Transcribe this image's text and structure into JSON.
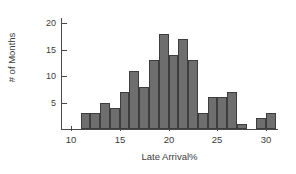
{
  "chart_data": {
    "type": "bar",
    "title": "",
    "xlabel": "Late Arrival%",
    "ylabel": "# of Months",
    "xlim": [
      9,
      31.2
    ],
    "ylim": [
      0,
      21
    ],
    "bin_width": 1,
    "grid": false,
    "legend": false,
    "bar_color": "#6e6e6e",
    "bar_edge_color": "#3d3d3d",
    "axis_color": "#4a4a4a",
    "text_color": "#3c3c3c",
    "xticks": [
      10,
      15,
      20,
      25,
      30
    ],
    "xtick_labels": [
      "10",
      "15",
      "20",
      "25",
      "30"
    ],
    "yticks": [
      5,
      10,
      15,
      20
    ],
    "ytick_labels": [
      "5",
      "10",
      "15",
      "20"
    ],
    "bins": [
      {
        "start": 11,
        "end": 12,
        "value": 3
      },
      {
        "start": 12,
        "end": 13,
        "value": 3
      },
      {
        "start": 13,
        "end": 14,
        "value": 5
      },
      {
        "start": 14,
        "end": 15,
        "value": 4
      },
      {
        "start": 15,
        "end": 16,
        "value": 7
      },
      {
        "start": 16,
        "end": 17,
        "value": 11
      },
      {
        "start": 17,
        "end": 18,
        "value": 8
      },
      {
        "start": 18,
        "end": 19,
        "value": 13
      },
      {
        "start": 19,
        "end": 20,
        "value": 18
      },
      {
        "start": 20,
        "end": 21,
        "value": 14
      },
      {
        "start": 21,
        "end": 22,
        "value": 17
      },
      {
        "start": 22,
        "end": 23,
        "value": 13
      },
      {
        "start": 23,
        "end": 24,
        "value": 3
      },
      {
        "start": 24,
        "end": 25,
        "value": 6
      },
      {
        "start": 25,
        "end": 26,
        "value": 6
      },
      {
        "start": 26,
        "end": 27,
        "value": 7
      },
      {
        "start": 27,
        "end": 28,
        "value": 1
      },
      {
        "start": 29,
        "end": 30,
        "value": 2
      },
      {
        "start": 30,
        "end": 31,
        "value": 3
      }
    ],
    "categories": [
      "11-12",
      "12-13",
      "13-14",
      "14-15",
      "15-16",
      "16-17",
      "17-18",
      "18-19",
      "19-20",
      "20-21",
      "21-22",
      "22-23",
      "23-24",
      "24-25",
      "25-26",
      "26-27",
      "27-28",
      "29-30",
      "30-31"
    ],
    "values": [
      3,
      3,
      5,
      4,
      7,
      11,
      8,
      13,
      18,
      14,
      17,
      13,
      3,
      6,
      6,
      7,
      1,
      2,
      3
    ]
  }
}
